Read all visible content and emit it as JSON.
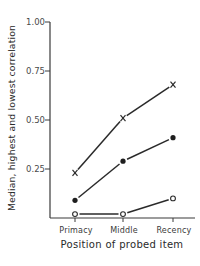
{
  "chart_data": {
    "type": "line",
    "title": "",
    "xlabel": "Position of probed item",
    "ylabel": "Median, highest and lowest correlation",
    "categories": [
      "Primacy",
      "Middle",
      "Recency"
    ],
    "ylim": [
      0,
      1.0
    ],
    "yticks": [
      0.25,
      0.5,
      0.75,
      1.0
    ],
    "ytick_labels": [
      "0.25",
      "0.50",
      "0.75",
      "1.00"
    ],
    "grid": false,
    "legend": null,
    "series": [
      {
        "name": "Highest",
        "marker": "x",
        "values": [
          0.23,
          0.51,
          0.68
        ]
      },
      {
        "name": "Median",
        "marker": "filled-circle",
        "values": [
          0.09,
          0.29,
          0.41
        ]
      },
      {
        "name": "Lowest",
        "marker": "open-circle",
        "values": [
          0.02,
          0.02,
          0.1
        ]
      }
    ]
  },
  "colors": {
    "axis": "#3a3a3a",
    "series": "#2a2a2a",
    "background": "#ffffff"
  }
}
